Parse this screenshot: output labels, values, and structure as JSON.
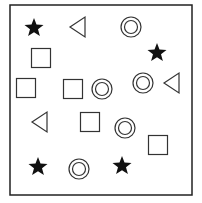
{
  "figure": {
    "frame": {
      "x": 10,
      "y": 5,
      "width": 182,
      "height": 190,
      "stroke": "#222222"
    },
    "colors": {
      "outline": "#333333",
      "fill_star": "#111111",
      "background": "#ffffff"
    },
    "shapes": [
      {
        "type": "star",
        "cx": 34,
        "cy": 28
      },
      {
        "type": "triangle-left",
        "cx": 78,
        "cy": 27
      },
      {
        "type": "double-circle",
        "cx": 131,
        "cy": 27
      },
      {
        "type": "square",
        "cx": 41,
        "cy": 58
      },
      {
        "type": "star",
        "cx": 157,
        "cy": 53
      },
      {
        "type": "square",
        "cx": 26,
        "cy": 88
      },
      {
        "type": "square",
        "cx": 73,
        "cy": 89
      },
      {
        "type": "double-circle",
        "cx": 102,
        "cy": 89
      },
      {
        "type": "double-circle",
        "cx": 143,
        "cy": 83
      },
      {
        "type": "triangle-left",
        "cx": 172,
        "cy": 83
      },
      {
        "type": "triangle-left",
        "cx": 40,
        "cy": 122
      },
      {
        "type": "square",
        "cx": 90,
        "cy": 122
      },
      {
        "type": "double-circle",
        "cx": 125,
        "cy": 128
      },
      {
        "type": "square",
        "cx": 158,
        "cy": 145
      },
      {
        "type": "star",
        "cx": 38,
        "cy": 167
      },
      {
        "type": "double-circle",
        "cx": 79,
        "cy": 169
      },
      {
        "type": "star",
        "cx": 122,
        "cy": 166
      }
    ]
  }
}
